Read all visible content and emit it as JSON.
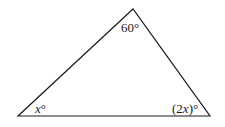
{
  "diagram": {
    "type": "triangle",
    "vertices": {
      "top": [
        133,
        9
      ],
      "bottom_left": [
        18,
        116
      ],
      "bottom_right": [
        210,
        116
      ]
    },
    "angles": {
      "top": {
        "label": "60°"
      },
      "bottom_left": {
        "var": "x",
        "suffix": "°"
      },
      "bottom_right": {
        "prefix": "(2",
        "var": "x",
        "suffix": ")°"
      }
    },
    "stroke_color": "#1a1a1a",
    "background": "#ffffff"
  }
}
